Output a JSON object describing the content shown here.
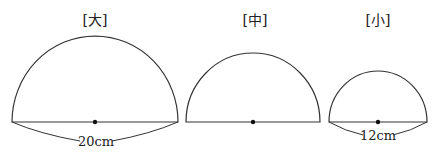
{
  "figures": [
    {
      "label": "[大]",
      "measure": "20cm",
      "cx": 95,
      "r": 83
    },
    {
      "label": "[中]",
      "measure": "",
      "cx": 253,
      "r": 67
    },
    {
      "label": "[小]",
      "measure": "12cm",
      "cx": 378,
      "r": 49
    }
  ],
  "baseline_y": 122,
  "colors": {
    "stroke": "#333333",
    "text": "#222222"
  }
}
